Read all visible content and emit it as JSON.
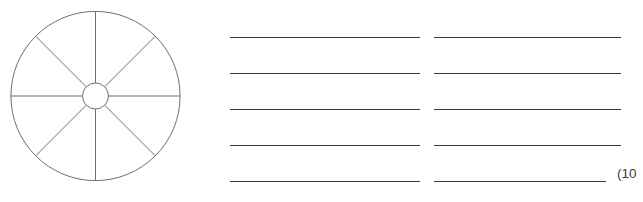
{
  "page": {
    "background_color": "#ffffff",
    "width": 643,
    "height": 202
  },
  "wheel_diagram": {
    "name": "eight-spoke-wheel",
    "description": "Circle divided into eight equal sectors by spokes radiating from a small central hub circle",
    "stroke_color": "#6e6e6e",
    "fill_color": "#ffffff",
    "center_x": 95.5,
    "center_y": 96,
    "outer_radius": 85,
    "hub_radius": 13,
    "spoke_count": 8,
    "spoke_angles_deg": [
      0,
      45,
      90,
      135,
      180,
      225,
      270,
      315
    ]
  },
  "answer_lines": {
    "name": "ruled-answer-lines",
    "stroke_color": "#393939",
    "columns": 2,
    "rows": 5,
    "row_y": [
      37,
      73,
      109,
      145,
      181
    ],
    "left_column_x": [
      230,
      420
    ],
    "right_column_x": [
      434,
      621
    ],
    "last_right_line_x": [
      434,
      606
    ]
  },
  "marks": {
    "label": "(10"
  }
}
